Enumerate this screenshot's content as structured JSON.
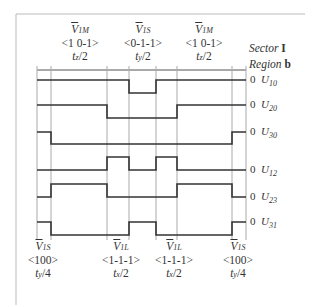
{
  "figure": {
    "sector_label": "Sector",
    "sector_value": "I",
    "region_label": "Region",
    "region_value": "b"
  },
  "top_vectors": [
    {
      "symbol": "V",
      "subscript": "1M",
      "state": "<1 0-1>",
      "time": "tz/2",
      "time_var": "t",
      "time_sub": "z",
      "time_div": "/2"
    },
    {
      "symbol": "V",
      "subscript": "1S",
      "state": "<0-1-1>",
      "time": "ty/2",
      "time_var": "t",
      "time_sub": "y",
      "time_div": "/2"
    },
    {
      "symbol": "V",
      "subscript": "1M",
      "state": "<1 0-1>",
      "time": "tz/2",
      "time_var": "t",
      "time_sub": "z",
      "time_div": "/2"
    }
  ],
  "bottom_vectors": [
    {
      "symbol": "V",
      "subscript": "1S",
      "state": "<100>",
      "time": "ty/4",
      "time_var": "t",
      "time_sub": "y",
      "time_div": "/4"
    },
    {
      "symbol": "V",
      "subscript": "1L",
      "state": "<1-1-1>",
      "time": "tx/2",
      "time_var": "t",
      "time_sub": "x",
      "time_div": "/2"
    },
    {
      "symbol": "V",
      "subscript": "1L",
      "state": "<1-1-1>",
      "time": "tx/2",
      "time_var": "t",
      "time_sub": "x",
      "time_div": "/2"
    },
    {
      "symbol": "V",
      "subscript": "1S",
      "state": "<100>",
      "time": "ty/4",
      "time_var": "t",
      "time_sub": "y",
      "time_div": "/4"
    }
  ],
  "waveforms": [
    {
      "name": "U",
      "sub": "10",
      "zero": "0"
    },
    {
      "name": "U",
      "sub": "20",
      "zero": "0"
    },
    {
      "name": "U",
      "sub": "30",
      "zero": "0"
    },
    {
      "name": "U",
      "sub": "12",
      "zero": "0"
    },
    {
      "name": "U",
      "sub": "23",
      "zero": "0"
    },
    {
      "name": "U",
      "sub": "31",
      "zero": "0"
    }
  ],
  "colors": {
    "line": "#333333",
    "grid": "#aaaaaa",
    "frame": "#bbbbbb"
  }
}
